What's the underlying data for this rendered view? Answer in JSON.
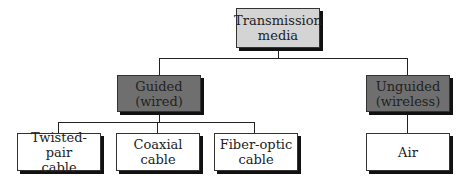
{
  "diagram": {
    "root": {
      "label_line1": "Transmission",
      "label_line2": "media"
    },
    "guided": {
      "label_line1": "Guided",
      "label_line2": "(wired)"
    },
    "unguided": {
      "label_line1": "Unguided",
      "label_line2": "(wireless)"
    },
    "leaves": [
      {
        "label_line1": "Twisted-pair",
        "label_line2": "cable"
      },
      {
        "label_line1": "Coaxial",
        "label_line2": "cable"
      },
      {
        "label_line1": "Fiber-optic",
        "label_line2": "cable"
      },
      {
        "label_line1": "Air",
        "label_line2": ""
      }
    ],
    "colors": {
      "root_fill": "#d4d4d4",
      "category_fill": "#6f6f6f",
      "leaf_fill": "#ffffff"
    }
  }
}
